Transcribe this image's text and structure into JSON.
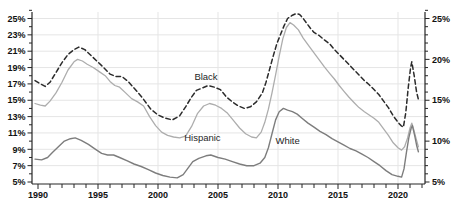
{
  "figure": {
    "width": 456,
    "height": 210,
    "background": "#ffffff"
  },
  "chart_data": {
    "type": "line",
    "title": "",
    "xlabel": "",
    "ylabel": "",
    "x_unit": "year",
    "y_unit": "percent",
    "xlim": [
      1989.75,
      2022.2
    ],
    "ylim": [
      5,
      26.5
    ],
    "x_tick_labels": [
      "1990",
      "1995",
      "2000",
      "2005",
      "2010",
      "2015",
      "2020"
    ],
    "x_tick_years": [
      1990,
      1995,
      2000,
      2005,
      2010,
      2015,
      2020
    ],
    "y_tick_labels_left": [
      "25%",
      "23%",
      "21%",
      "19%",
      "17%",
      "15%",
      "13%",
      "11%",
      "9%",
      "7%",
      "5%"
    ],
    "y_tick_values_left": [
      25,
      23,
      21,
      19,
      17,
      15,
      13,
      11,
      9,
      7,
      5
    ],
    "y_tick_labels_right": [
      "25%",
      "20%",
      "15%",
      "10%",
      "5%"
    ],
    "y_tick_values_right": [
      25,
      20,
      15,
      10,
      5
    ],
    "grid": {
      "horizontal_every_pct": 2,
      "vertical_every_years": 5,
      "on": true
    },
    "legend_position": "inline-labels",
    "colors": {
      "grid": "#e5e5e5",
      "axis": "#262626",
      "tick_text": "#111111",
      "label_text": "#262626"
    },
    "series": [
      {
        "name": "Black",
        "style": "dashed",
        "color": "#2b2b2b",
        "width": 1.5,
        "points": [
          [
            1989.75,
            17.4
          ],
          [
            1990.2,
            17.0
          ],
          [
            1990.6,
            16.7
          ],
          [
            1991.0,
            17.2
          ],
          [
            1991.5,
            18.4
          ],
          [
            1992.0,
            19.6
          ],
          [
            1992.5,
            20.6
          ],
          [
            1993.0,
            21.2
          ],
          [
            1993.4,
            21.5
          ],
          [
            1993.9,
            21.2
          ],
          [
            1994.4,
            20.5
          ],
          [
            1994.9,
            19.8
          ],
          [
            1995.4,
            19.1
          ],
          [
            1996.0,
            18.2
          ],
          [
            1996.5,
            17.9
          ],
          [
            1997.0,
            17.9
          ],
          [
            1997.5,
            17.3
          ],
          [
            1998.0,
            16.5
          ],
          [
            1998.7,
            15.3
          ],
          [
            1999.4,
            13.9
          ],
          [
            2000.0,
            13.2
          ],
          [
            2000.6,
            12.8
          ],
          [
            2001.2,
            12.6
          ],
          [
            2001.8,
            13.1
          ],
          [
            2002.3,
            14.2
          ],
          [
            2002.8,
            15.4
          ],
          [
            2003.2,
            16.2
          ],
          [
            2003.7,
            16.5
          ],
          [
            2004.2,
            16.8
          ],
          [
            2004.7,
            16.6
          ],
          [
            2005.2,
            16.3
          ],
          [
            2005.7,
            15.4
          ],
          [
            2006.2,
            14.8
          ],
          [
            2006.7,
            14.3
          ],
          [
            2007.2,
            14.0
          ],
          [
            2007.7,
            14.2
          ],
          [
            2008.2,
            14.8
          ],
          [
            2008.7,
            15.9
          ],
          [
            2009.0,
            17.2
          ],
          [
            2009.3,
            18.8
          ],
          [
            2009.6,
            20.4
          ],
          [
            2009.9,
            21.9
          ],
          [
            2010.2,
            23.0
          ],
          [
            2010.5,
            24.1
          ],
          [
            2010.8,
            25.0
          ],
          [
            2011.2,
            25.4
          ],
          [
            2011.5,
            25.6
          ],
          [
            2011.8,
            25.5
          ],
          [
            2012.1,
            25.0
          ],
          [
            2012.4,
            24.4
          ],
          [
            2012.7,
            23.8
          ],
          [
            2013.0,
            23.3
          ],
          [
            2013.45,
            22.9
          ],
          [
            2013.85,
            22.4
          ],
          [
            2014.3,
            21.9
          ],
          [
            2014.7,
            21.2
          ],
          [
            2015.1,
            20.6
          ],
          [
            2015.5,
            20.0
          ],
          [
            2015.9,
            19.4
          ],
          [
            2016.35,
            18.7
          ],
          [
            2016.75,
            18.1
          ],
          [
            2017.2,
            17.4
          ],
          [
            2017.6,
            16.9
          ],
          [
            2018.0,
            16.3
          ],
          [
            2018.4,
            15.7
          ],
          [
            2018.8,
            14.9
          ],
          [
            2019.2,
            14.1
          ],
          [
            2019.6,
            13.1
          ],
          [
            2020.0,
            12.3
          ],
          [
            2020.25,
            11.9
          ],
          [
            2020.45,
            11.7
          ],
          [
            2020.65,
            13.5
          ],
          [
            2020.85,
            16.5
          ],
          [
            2021.05,
            19.0
          ],
          [
            2021.15,
            19.7
          ],
          [
            2021.35,
            18.0
          ],
          [
            2021.55,
            16.0
          ],
          [
            2021.7,
            15.1
          ]
        ]
      },
      {
        "name": "Hispanic",
        "style": "solid",
        "color": "#adadad",
        "width": 1.3,
        "points": [
          [
            1989.75,
            14.6
          ],
          [
            1990.2,
            14.4
          ],
          [
            1990.6,
            14.3
          ],
          [
            1991.0,
            14.9
          ],
          [
            1991.5,
            15.9
          ],
          [
            1992.0,
            17.2
          ],
          [
            1992.5,
            18.7
          ],
          [
            1993.0,
            19.7
          ],
          [
            1993.3,
            20.0
          ],
          [
            1993.7,
            19.8
          ],
          [
            1994.1,
            19.4
          ],
          [
            1994.6,
            19.0
          ],
          [
            1995.1,
            18.5
          ],
          [
            1995.6,
            18.0
          ],
          [
            1996.0,
            17.3
          ],
          [
            1996.4,
            16.8
          ],
          [
            1996.8,
            16.6
          ],
          [
            1997.3,
            15.9
          ],
          [
            1997.8,
            15.2
          ],
          [
            1998.3,
            14.8
          ],
          [
            1998.8,
            14.3
          ],
          [
            1999.3,
            13.0
          ],
          [
            1999.8,
            11.9
          ],
          [
            2000.3,
            11.1
          ],
          [
            2000.8,
            10.7
          ],
          [
            2001.3,
            10.5
          ],
          [
            2001.8,
            10.4
          ],
          [
            2002.3,
            10.6
          ],
          [
            2002.8,
            11.8
          ],
          [
            2003.3,
            13.4
          ],
          [
            2003.8,
            14.3
          ],
          [
            2004.3,
            14.6
          ],
          [
            2004.8,
            14.4
          ],
          [
            2005.3,
            14.0
          ],
          [
            2005.8,
            13.4
          ],
          [
            2006.3,
            12.5
          ],
          [
            2006.8,
            11.6
          ],
          [
            2007.3,
            10.9
          ],
          [
            2007.8,
            10.5
          ],
          [
            2008.2,
            10.4
          ],
          [
            2008.6,
            11.1
          ],
          [
            2008.9,
            12.3
          ],
          [
            2009.2,
            13.9
          ],
          [
            2009.5,
            15.9
          ],
          [
            2009.8,
            18.1
          ],
          [
            2010.1,
            20.4
          ],
          [
            2010.4,
            22.5
          ],
          [
            2010.7,
            23.9
          ],
          [
            2011.0,
            24.5
          ],
          [
            2011.3,
            24.2
          ],
          [
            2011.7,
            23.6
          ],
          [
            2012.1,
            22.6
          ],
          [
            2012.6,
            21.6
          ],
          [
            2013.0,
            20.8
          ],
          [
            2013.45,
            19.9
          ],
          [
            2013.85,
            19.1
          ],
          [
            2014.3,
            18.3
          ],
          [
            2014.7,
            17.6
          ],
          [
            2015.1,
            16.8
          ],
          [
            2015.5,
            16.1
          ],
          [
            2015.9,
            15.4
          ],
          [
            2016.35,
            14.7
          ],
          [
            2016.75,
            14.1
          ],
          [
            2017.2,
            13.6
          ],
          [
            2017.6,
            13.2
          ],
          [
            2018.0,
            12.8
          ],
          [
            2018.4,
            12.3
          ],
          [
            2018.8,
            11.5
          ],
          [
            2019.2,
            10.7
          ],
          [
            2019.6,
            9.8
          ],
          [
            2020.0,
            9.2
          ],
          [
            2020.3,
            8.9
          ],
          [
            2020.55,
            9.3
          ],
          [
            2020.8,
            10.4
          ],
          [
            2021.0,
            11.6
          ],
          [
            2021.15,
            12.2
          ],
          [
            2021.35,
            11.2
          ],
          [
            2021.55,
            10.1
          ],
          [
            2021.7,
            9.3
          ]
        ]
      },
      {
        "name": "White",
        "style": "solid",
        "color": "#7d7d7d",
        "width": 1.4,
        "points": [
          [
            1989.75,
            7.8
          ],
          [
            1990.3,
            7.7
          ],
          [
            1990.8,
            8.0
          ],
          [
            1991.2,
            8.6
          ],
          [
            1991.7,
            9.3
          ],
          [
            1992.2,
            10.0
          ],
          [
            1992.7,
            10.3
          ],
          [
            1993.1,
            10.4
          ],
          [
            1993.6,
            10.1
          ],
          [
            1994.2,
            9.6
          ],
          [
            1994.8,
            9.0
          ],
          [
            1995.3,
            8.5
          ],
          [
            1995.8,
            8.3
          ],
          [
            1996.3,
            8.3
          ],
          [
            1996.8,
            8.0
          ],
          [
            1997.4,
            7.6
          ],
          [
            1998.0,
            7.2
          ],
          [
            1998.6,
            6.9
          ],
          [
            1999.2,
            6.5
          ],
          [
            1999.8,
            6.1
          ],
          [
            2000.4,
            5.8
          ],
          [
            2001.0,
            5.6
          ],
          [
            2001.6,
            5.5
          ],
          [
            2002.1,
            5.9
          ],
          [
            2002.5,
            6.7
          ],
          [
            2002.9,
            7.5
          ],
          [
            2003.4,
            7.9
          ],
          [
            2004.0,
            8.2
          ],
          [
            2004.4,
            8.3
          ],
          [
            2005.0,
            8.0
          ],
          [
            2005.6,
            7.8
          ],
          [
            2006.2,
            7.5
          ],
          [
            2006.8,
            7.2
          ],
          [
            2007.4,
            7.0
          ],
          [
            2008.0,
            7.0
          ],
          [
            2008.5,
            7.3
          ],
          [
            2008.9,
            8.0
          ],
          [
            2009.2,
            9.2
          ],
          [
            2009.5,
            10.9
          ],
          [
            2009.8,
            12.6
          ],
          [
            2010.1,
            13.6
          ],
          [
            2010.45,
            14.0
          ],
          [
            2010.8,
            13.8
          ],
          [
            2011.2,
            13.6
          ],
          [
            2011.6,
            13.3
          ],
          [
            2012.0,
            12.8
          ],
          [
            2012.5,
            12.2
          ],
          [
            2013.0,
            11.7
          ],
          [
            2013.5,
            11.2
          ],
          [
            2014.0,
            10.8
          ],
          [
            2014.5,
            10.3
          ],
          [
            2015.0,
            9.9
          ],
          [
            2015.5,
            9.5
          ],
          [
            2016.0,
            9.1
          ],
          [
            2016.5,
            8.8
          ],
          [
            2017.0,
            8.4
          ],
          [
            2017.5,
            8.0
          ],
          [
            2018.0,
            7.5
          ],
          [
            2018.5,
            7.0
          ],
          [
            2019.0,
            6.4
          ],
          [
            2019.5,
            5.9
          ],
          [
            2020.0,
            5.7
          ],
          [
            2020.3,
            5.6
          ],
          [
            2020.5,
            6.6
          ],
          [
            2020.7,
            8.6
          ],
          [
            2020.9,
            10.4
          ],
          [
            2021.1,
            11.6
          ],
          [
            2021.2,
            11.9
          ],
          [
            2021.4,
            10.6
          ],
          [
            2021.55,
            9.5
          ],
          [
            2021.7,
            8.7
          ]
        ]
      }
    ],
    "annotations": [
      {
        "text": "Black",
        "year": 2004.0,
        "value": 17.9
      },
      {
        "text": "Hispanic",
        "year": 2003.7,
        "value": 10.4
      },
      {
        "text": "White",
        "year": 2010.8,
        "value": 10.0
      }
    ]
  }
}
